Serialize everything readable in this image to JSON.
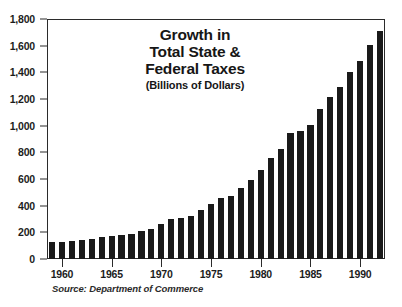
{
  "chart_data": {
    "type": "bar",
    "title": "Growth in Total State & Federal Taxes",
    "title_lines": [
      "Growth in",
      "Total State &",
      "Federal Taxes"
    ],
    "subtitle": "(Billions of Dollars)",
    "xlabel": "",
    "ylabel": "",
    "ylim": [
      0,
      1800
    ],
    "ytick_labels": [
      "1,800",
      "1,600",
      "1,400",
      "1,200",
      "1,000",
      "800",
      "600",
      "400",
      "200",
      "0"
    ],
    "ytick_values": [
      1800,
      1600,
      1400,
      1200,
      1000,
      800,
      600,
      400,
      200,
      0
    ],
    "xtick_labels": [
      "1960",
      "1965",
      "1970",
      "1975",
      "1980",
      "1985",
      "1990"
    ],
    "xtick_values": [
      1960,
      1965,
      1970,
      1975,
      1980,
      1985,
      1990
    ],
    "grid": false,
    "legend": false,
    "bar_color": "#1a1a1a",
    "axis_color": "#2b2b2b",
    "background": "#ffffff",
    "source": "Source: Department of Commerce",
    "categories": [
      1959,
      1960,
      1961,
      1962,
      1963,
      1964,
      1965,
      1966,
      1967,
      1968,
      1969,
      1970,
      1971,
      1972,
      1973,
      1974,
      1975,
      1976,
      1977,
      1978,
      1979,
      1980,
      1981,
      1982,
      1983,
      1984,
      1985,
      1986,
      1987,
      1988,
      1989,
      1990,
      1991,
      1992
    ],
    "values": [
      130,
      128,
      134,
      140,
      152,
      162,
      170,
      178,
      190,
      212,
      228,
      260,
      298,
      305,
      322,
      365,
      413,
      455,
      472,
      530,
      595,
      670,
      757,
      822,
      942,
      962,
      1008,
      1125,
      1218,
      1292,
      1402,
      1488,
      1608,
      1708
    ]
  }
}
